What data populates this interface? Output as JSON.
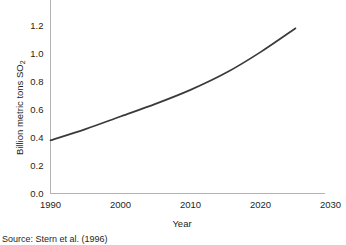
{
  "figure": {
    "source_note": "Source: Stern et al. (1996)"
  },
  "chart_data": {
    "type": "line",
    "title": "",
    "subtitle": "",
    "xlabel": "Year",
    "ylabel": "Billion metric tons SO2",
    "ylabel_base": "Billion metric tons SO",
    "ylabel_subscript": "2",
    "xlim": [
      1990,
      2036
    ],
    "ylim": [
      0.0,
      1.25
    ],
    "xticks": [
      1990,
      2000,
      2010,
      2020,
      2030
    ],
    "xtick_labels": [
      "1990",
      "2000",
      "2010",
      "2020",
      "2030"
    ],
    "yticks": [
      0.0,
      0.2,
      0.4,
      0.6,
      0.8,
      1.0,
      1.2
    ],
    "ytick_labels": [
      "0.0",
      "0.2",
      "0.4",
      "0.6",
      "0.8",
      "1.0",
      "1.2"
    ],
    "grid": false,
    "legend": false,
    "legend_position": "none",
    "line_color": "#3a3a3a",
    "axis_color": "#b3b3b3",
    "series": [
      {
        "name": "Global SO2 emissions projection",
        "x": [
          1990,
          1995,
          2000,
          2005,
          2010,
          2015,
          2020,
          2025
        ],
        "values": [
          0.38,
          0.46,
          0.55,
          0.64,
          0.74,
          0.86,
          1.01,
          1.18
        ]
      }
    ]
  }
}
